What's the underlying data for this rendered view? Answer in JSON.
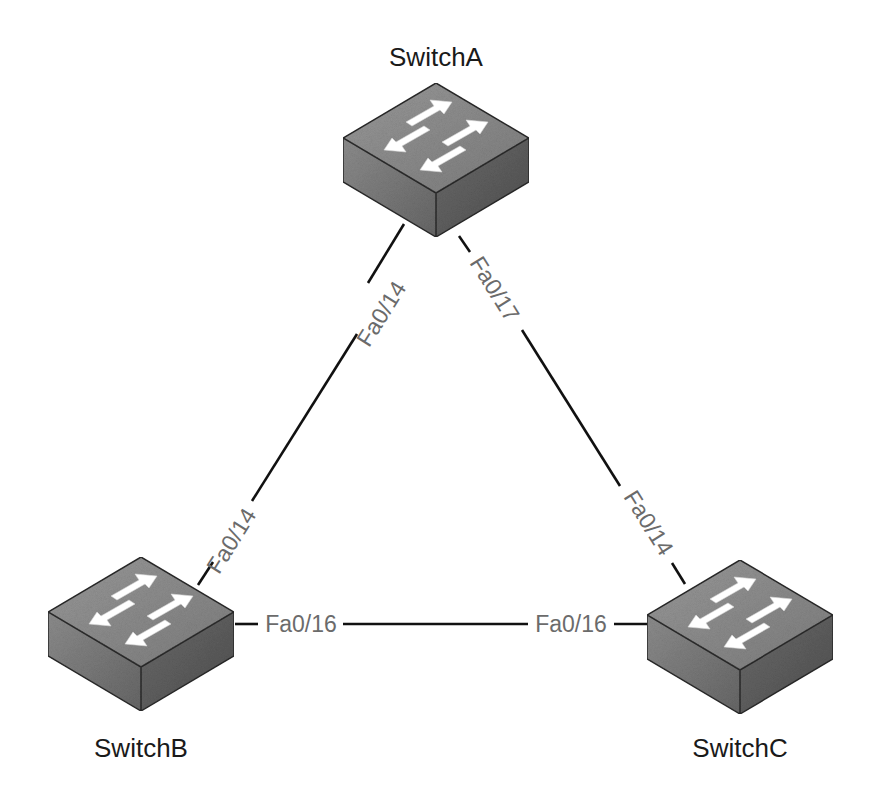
{
  "diagram": {
    "type": "network-topology",
    "title_fragment": "",
    "colors": {
      "background": "#ffffff",
      "link": "#111111",
      "port_label": "#6b6b6b",
      "device_label": "#1a1a1a",
      "switch_top": "#8a8a8a",
      "switch_left": "#7a7a7a",
      "switch_right": "#5e5e5e",
      "switch_arrows": "#ffffff"
    },
    "devices": [
      {
        "id": "SwitchA",
        "label": "SwitchA",
        "type": "switch",
        "icon": "switch-icon"
      },
      {
        "id": "SwitchB",
        "label": "SwitchB",
        "type": "switch",
        "icon": "switch-icon"
      },
      {
        "id": "SwitchC",
        "label": "SwitchC",
        "type": "switch",
        "icon": "switch-icon"
      }
    ],
    "links": [
      {
        "from": "SwitchA",
        "from_port": "Fa0/14",
        "to": "SwitchB",
        "to_port": "Fa0/14"
      },
      {
        "from": "SwitchA",
        "from_port": "Fa0/17",
        "to": "SwitchC",
        "to_port": "Fa0/14"
      },
      {
        "from": "SwitchB",
        "from_port": "Fa0/16",
        "to": "SwitchC",
        "to_port": "Fa0/16"
      }
    ]
  }
}
